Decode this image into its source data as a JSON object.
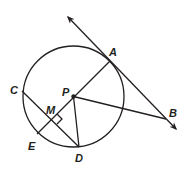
{
  "diagram": {
    "type": "geometry",
    "circle": {
      "center": "P",
      "cx": 73.5,
      "cy": 96.5,
      "r": 50.5
    },
    "points": {
      "A": {
        "x": 110,
        "y": 61,
        "label": "A",
        "lx": 109,
        "ly": 56
      },
      "B": {
        "x": 166,
        "y": 119,
        "label": "B",
        "lx": 170,
        "ly": 116
      },
      "C": {
        "x": 22,
        "y": 91,
        "label": "C",
        "lx": 10,
        "ly": 91
      },
      "D": {
        "x": 79,
        "y": 147,
        "label": "D",
        "lx": 76,
        "ly": 161
      },
      "E": {
        "x": 37,
        "y": 134,
        "label": "E",
        "lx": 28,
        "ly": 149
      },
      "M": {
        "x": 52,
        "y": 119,
        "label": "M",
        "lx": 46,
        "ly": 113
      },
      "P": {
        "x": 73.5,
        "y": 96.5,
        "label": "P",
        "lx": 62,
        "ly": 95
      }
    },
    "segments": [
      {
        "name": "AE",
        "from": "A",
        "to": "E",
        "note": "diameter through P"
      },
      {
        "name": "CD",
        "from": "C",
        "to": "D",
        "note": "chord perpendicular to AE at M"
      },
      {
        "name": "PD",
        "from": "P",
        "to": "D",
        "note": "radius"
      },
      {
        "name": "PB",
        "from": "P",
        "to": "B"
      }
    ],
    "rays": [
      {
        "name": "tangent-line-AB",
        "through": [
          "A",
          "B"
        ],
        "start": {
          "x": 68,
          "y": 17
        },
        "end": {
          "x": 176,
          "y": 129
        },
        "arrows": "both",
        "note": "tangent to circle at A"
      }
    ],
    "right_angle_marker": {
      "at": "M"
    },
    "colors": {
      "stroke": "#231f20",
      "background": "#ffffff"
    }
  }
}
